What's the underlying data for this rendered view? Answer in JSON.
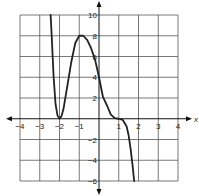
{
  "chart_data": {
    "type": "line",
    "title": "",
    "xlabel": "x",
    "ylabel": "",
    "xlim": [
      -4,
      4
    ],
    "ylim": [
      -6,
      10
    ],
    "grid": true,
    "x_ticks": [
      -4,
      -3,
      -2,
      -1,
      1,
      2,
      3,
      4
    ],
    "x_tick_labels": [
      "−4",
      "−3",
      "−2",
      "−1",
      "1",
      "2",
      "3",
      "4"
    ],
    "y_ticks": [
      10,
      8,
      6,
      4,
      2,
      -2,
      -4,
      -6
    ],
    "y_tick_labels": [
      "10",
      "8",
      "6",
      "4",
      "2",
      "−2",
      "−4",
      "−6"
    ],
    "series": [
      {
        "name": "f(x)",
        "description": "polynomial curve: double root at x=-2, local max about 8.3 near x=-1, y-intercept 4, triple root at x=1",
        "points": [
          [
            -2.45,
            10.0
          ],
          [
            -2.4,
            8.2
          ],
          [
            -2.3,
            4.1
          ],
          [
            -2.2,
            1.4
          ],
          [
            -2.1,
            0.3
          ],
          [
            -2.0,
            0.0
          ],
          [
            -1.9,
            0.25
          ],
          [
            -1.8,
            0.93
          ],
          [
            -1.6,
            3.2
          ],
          [
            -1.4,
            5.5
          ],
          [
            -1.2,
            7.3
          ],
          [
            -1.0,
            8.0
          ],
          [
            -0.8,
            8.0
          ],
          [
            -0.6,
            7.6
          ],
          [
            -0.4,
            6.8
          ],
          [
            -0.2,
            5.7
          ],
          [
            0.0,
            4.0
          ],
          [
            0.2,
            2.1
          ],
          [
            0.4,
            1.3
          ],
          [
            0.6,
            0.4
          ],
          [
            0.8,
            0.06
          ],
          [
            1.0,
            0.0
          ],
          [
            1.2,
            -0.1
          ],
          [
            1.4,
            -0.75
          ],
          [
            1.5,
            -1.6
          ],
          [
            1.6,
            -2.9
          ],
          [
            1.7,
            -4.5
          ],
          [
            1.78,
            -6.0
          ]
        ]
      }
    ]
  }
}
